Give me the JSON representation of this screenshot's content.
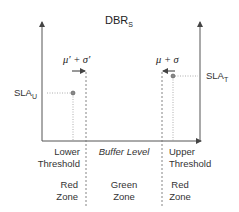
{
  "title": {
    "main": "DBR",
    "sub": "S"
  },
  "sla_upper": {
    "main": "SLA",
    "sub": "U"
  },
  "sla_target": {
    "main": "SLA",
    "sub": "T"
  },
  "lower_stat": "μ' + σ'",
  "upper_stat": "μ + σ",
  "x_axis_label": "Buffer Level",
  "lower_threshold": {
    "line1": "Lower",
    "line2": "Threshold"
  },
  "upper_threshold": {
    "line1": "Upper",
    "line2": "Threshold"
  },
  "zones": [
    {
      "line1": "Red",
      "line2": "Zone"
    },
    {
      "line1": "Green",
      "line2": "Zone"
    },
    {
      "line1": "Red",
      "line2": "Zone"
    }
  ],
  "colors": {
    "axis": "#555555",
    "dashed": "#777777",
    "dotted": "#999999",
    "text": "#333333"
  }
}
